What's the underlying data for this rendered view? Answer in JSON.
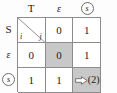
{
  "figure": {
    "colors": {
      "shade": "#c8c8c8",
      "grid_line": "#8c8c8c",
      "background": "#ffffff",
      "text": "#1a1a1a"
    }
  },
  "corner": {
    "row_index_label": "i",
    "col_index_label": "j"
  },
  "columns": [
    {
      "label": "T",
      "style": "plain"
    },
    {
      "label": "ε",
      "style": "italic"
    },
    {
      "label": "s",
      "style": "circled"
    }
  ],
  "rows": [
    {
      "label": "S",
      "style": "plain",
      "cells": [
        {
          "value": "",
          "shaded": false,
          "kind": "split"
        },
        {
          "value": "0",
          "shaded": false,
          "kind": "value"
        },
        {
          "value": "1",
          "shaded": false,
          "kind": "value"
        }
      ]
    },
    {
      "label": "ε",
      "style": "italic",
      "cells": [
        {
          "value": "0",
          "shaded": false,
          "kind": "value"
        },
        {
          "value": "0",
          "shaded": true,
          "kind": "value"
        },
        {
          "value": "1",
          "shaded": false,
          "kind": "value"
        }
      ]
    },
    {
      "label": "s",
      "style": "circled",
      "cells": [
        {
          "value": "1",
          "shaded": false,
          "kind": "value"
        },
        {
          "value": "1",
          "shaded": false,
          "kind": "value"
        },
        {
          "value": "(2)",
          "shaded": true,
          "kind": "annotated"
        }
      ]
    }
  ],
  "annotation": {
    "arrow_icon": "right-arrow-icon",
    "target_value": "(2)"
  }
}
